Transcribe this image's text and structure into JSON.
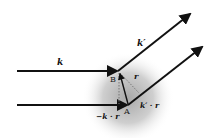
{
  "diagram": {
    "type": "scattering-geometry",
    "colors": {
      "arrow": "#111111",
      "sphere_center": "#a8a8a8",
      "sphere_edge": "#ffffff",
      "dotted": "#777777"
    },
    "labels": {
      "incident_wavevector": "k",
      "scattered_wavevector": "k′",
      "point_b": "B",
      "point_a": "A",
      "position_vector": "r",
      "incident_path_difference": "−k · r",
      "scattered_path_difference": "k′ · r"
    }
  }
}
